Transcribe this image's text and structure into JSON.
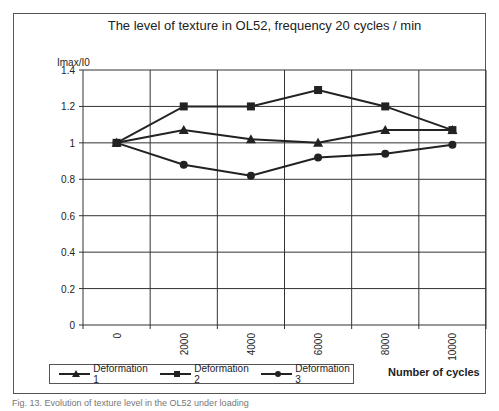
{
  "chart_data": {
    "type": "line",
    "title": "The level of texture in OL52, frequency 20 cycles / min",
    "xlabel": "Number of cycles",
    "ylabel": "Imax/I0",
    "x": [
      0,
      2000,
      4000,
      6000,
      8000,
      10000
    ],
    "categories": [
      "0",
      "2000",
      "4000",
      "6000",
      "8000",
      "10000"
    ],
    "series": [
      {
        "name": "Deformation 1",
        "marker": "triangle",
        "values": [
          1.0,
          1.07,
          1.02,
          1.0,
          1.07,
          1.07
        ]
      },
      {
        "name": "Deformation 2",
        "marker": "square",
        "values": [
          1.0,
          1.2,
          1.2,
          1.29,
          1.2,
          1.07
        ]
      },
      {
        "name": "Deformation 3",
        "marker": "circle",
        "values": [
          1.0,
          0.88,
          0.82,
          0.92,
          0.94,
          0.99
        ]
      }
    ],
    "ylim": [
      0,
      1.4
    ],
    "yticks": [
      "0",
      "0.2",
      "0.4",
      "0.6",
      "0.8",
      "1",
      "1.2",
      "1.4"
    ],
    "grid": true,
    "legend_position": "bottom-left"
  },
  "labels": {
    "title": "The level of texture in OL52, frequency 20 cycles / min",
    "ylabel": "Imax/I0",
    "xlabel": "Number of cycles",
    "legend": [
      "Deformation 1",
      "Deformation 2",
      "Deformation 3"
    ],
    "caption": "Fig. 13. Evolution of texture level in the OL52 under loading"
  },
  "colors": {
    "line": "#222222",
    "grid": "#333333",
    "frame": "#555555"
  }
}
